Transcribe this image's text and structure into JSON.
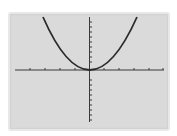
{
  "graph": {
    "function": "y = x^2",
    "x_ticks_each_side": 5,
    "y_ticks_up": 10,
    "y_ticks_down": 10,
    "colors": {
      "screen": "#dadada",
      "axis": "#3a3a3a",
      "curve": "#2b2b2b"
    }
  }
}
